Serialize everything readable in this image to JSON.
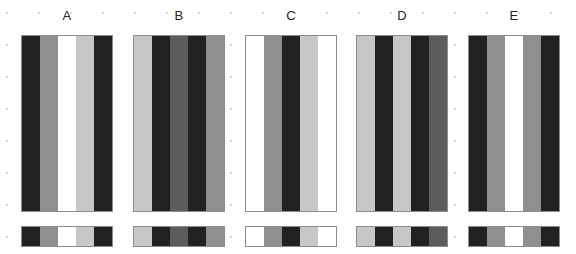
{
  "figure": {
    "background_color": "#fdfdfd",
    "grid_dot_color": "#d7d7d7",
    "border_color": "#8d8d8d",
    "panel_count": 5
  },
  "chart_data": {
    "type": "heatmap",
    "title": "",
    "subtitle": "",
    "xlabel": "",
    "ylabel": "",
    "legend": "none",
    "grid": "dotted-background",
    "categories": [
      "A",
      "B",
      "C",
      "D",
      "E"
    ],
    "band_count_per_panel": 5,
    "value_scale": "grayscale 0 (black) to 1 (white)",
    "series": [
      {
        "name": "A",
        "values": [
          0.13,
          0.56,
          1.0,
          0.78,
          0.13
        ],
        "colors": [
          "#212121",
          "#8f8f8f",
          "#ffffff",
          "#c7c7c7",
          "#212121"
        ]
      },
      {
        "name": "B",
        "values": [
          0.78,
          0.13,
          0.36,
          0.13,
          0.56
        ],
        "colors": [
          "#c7c7c7",
          "#212121",
          "#5c5c5c",
          "#212121",
          "#8f8f8f"
        ]
      },
      {
        "name": "C",
        "values": [
          1.0,
          0.56,
          0.13,
          0.78,
          1.0
        ],
        "colors": [
          "#ffffff",
          "#8f8f8f",
          "#212121",
          "#c7c7c7",
          "#ffffff"
        ]
      },
      {
        "name": "D",
        "values": [
          0.78,
          0.13,
          0.78,
          0.13,
          0.36
        ],
        "colors": [
          "#c7c7c7",
          "#212121",
          "#c7c7c7",
          "#212121",
          "#5c5c5c"
        ]
      },
      {
        "name": "E",
        "values": [
          0.13,
          0.56,
          1.0,
          0.56,
          0.13
        ],
        "colors": [
          "#212121",
          "#8f8f8f",
          "#ffffff",
          "#8f8f8f",
          "#212121"
        ]
      }
    ]
  }
}
